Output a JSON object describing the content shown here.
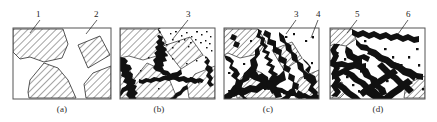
{
  "figure": {
    "kind": "micrograph-schematic-series",
    "background_color": "#ffffff",
    "ink_color": "#1a1a1a",
    "grain_fill_color": "#ffffff",
    "hatch_color": "#4a4a4a",
    "corrosion_color": "#111111",
    "panel_border_color": "#555555",
    "panel_count": 4
  },
  "panels": [
    {
      "id": "a",
      "caption": "(a)",
      "box": {
        "x": 13,
        "y": 28,
        "w": 98,
        "h": 71
      },
      "caption_pos": {
        "x": 42,
        "y": 104
      },
      "description": "intact hatched grains separated by clean white boundaries",
      "corrosion_level": 0,
      "callouts": [
        {
          "label": "1",
          "text_pos": {
            "x": 36,
            "y": 10
          },
          "line": {
            "x1": 40,
            "y1": 20,
            "x2": 30,
            "y2": 33
          }
        },
        {
          "label": "2",
          "text_pos": {
            "x": 94,
            "y": 10
          },
          "line": {
            "x1": 97,
            "y1": 20,
            "x2": 86,
            "y2": 34
          }
        }
      ]
    },
    {
      "id": "b",
      "caption": "(b)",
      "box": {
        "x": 120,
        "y": 28,
        "w": 95,
        "h": 71
      },
      "caption_pos": {
        "x": 139,
        "y": 104
      },
      "description": "grain boundaries darkened by incipient corrosion with scattered pits",
      "corrosion_level": 1,
      "callouts": [
        {
          "label": "3",
          "text_pos": {
            "x": 186,
            "y": 10
          },
          "line": {
            "x1": 188,
            "y1": 20,
            "x2": 172,
            "y2": 40
          }
        }
      ]
    },
    {
      "id": "c",
      "caption": "(c)",
      "box": {
        "x": 224,
        "y": 28,
        "w": 95,
        "h": 71
      },
      "caption_pos": {
        "x": 248,
        "y": 104
      },
      "description": "thick dendritic corrosion network consuming much of the matrix",
      "corrosion_level": 2,
      "callouts": [
        {
          "label": "3",
          "text_pos": {
            "x": 294,
            "y": 10
          },
          "line": {
            "x1": 296,
            "y1": 20,
            "x2": 286,
            "y2": 34
          }
        },
        {
          "label": "4",
          "text_pos": {
            "x": 316,
            "y": 10
          },
          "line": {
            "x1": 318,
            "y1": 20,
            "x2": 311,
            "y2": 38
          }
        }
      ]
    },
    {
      "id": "d",
      "caption": "(d)",
      "box": {
        "x": 330,
        "y": 28,
        "w": 95,
        "h": 71
      },
      "caption_pos": {
        "x": 358,
        "y": 104
      },
      "description": "near-complete corrosion, only small hatched remnants left at corners",
      "corrosion_level": 3,
      "callouts": [
        {
          "label": "5",
          "text_pos": {
            "x": 355,
            "y": 10
          },
          "line": {
            "x1": 357,
            "y1": 20,
            "x2": 347,
            "y2": 33
          }
        },
        {
          "label": "6",
          "text_pos": {
            "x": 406,
            "y": 10
          },
          "line": {
            "x1": 408,
            "y1": 20,
            "x2": 398,
            "y2": 34
          }
        }
      ]
    }
  ],
  "callout_legend": {
    "1": "1",
    "2": "2",
    "3": "3",
    "4": "4",
    "5": "5",
    "6": "6"
  }
}
